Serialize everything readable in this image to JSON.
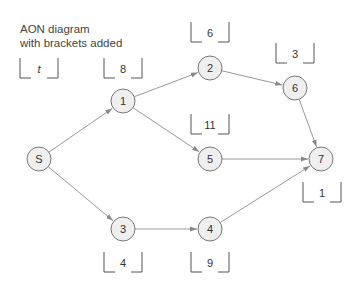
{
  "title": {
    "line1": "AON diagram",
    "line2": "with brackets added"
  },
  "nodes": [
    {
      "id": "S",
      "label": "S",
      "x": 39,
      "y": 159
    },
    {
      "id": "1",
      "label": "1",
      "x": 123,
      "y": 101
    },
    {
      "id": "2",
      "label": "2",
      "x": 210,
      "y": 68
    },
    {
      "id": "6",
      "label": "6",
      "x": 295,
      "y": 88
    },
    {
      "id": "5",
      "label": "5",
      "x": 210,
      "y": 159
    },
    {
      "id": "7",
      "label": "7",
      "x": 321,
      "y": 159
    },
    {
      "id": "3",
      "label": "3",
      "x": 123,
      "y": 229
    },
    {
      "id": "4",
      "label": "4",
      "x": 210,
      "y": 229
    }
  ],
  "edges": [
    {
      "from": "S",
      "to": "1"
    },
    {
      "from": "S",
      "to": "3"
    },
    {
      "from": "1",
      "to": "2"
    },
    {
      "from": "1",
      "to": "5"
    },
    {
      "from": "2",
      "to": "6"
    },
    {
      "from": "6",
      "to": "7"
    },
    {
      "from": "5",
      "to": "7"
    },
    {
      "from": "3",
      "to": "4"
    },
    {
      "from": "4",
      "to": "7"
    }
  ],
  "brackets": [
    {
      "label": "t",
      "italic": true,
      "x": 20,
      "y": 58,
      "w": 38,
      "h": 20
    },
    {
      "label": "8",
      "x": 104,
      "y": 58,
      "w": 38,
      "h": 20
    },
    {
      "label": "6",
      "x": 191,
      "y": 22,
      "w": 38,
      "h": 20
    },
    {
      "label": "3",
      "x": 276,
      "y": 43,
      "w": 38,
      "h": 20
    },
    {
      "label": "11",
      "x": 191,
      "y": 114,
      "w": 38,
      "h": 20
    },
    {
      "label": "1",
      "x": 303,
      "y": 182,
      "w": 38,
      "h": 20
    },
    {
      "label": "4",
      "x": 104,
      "y": 252,
      "w": 38,
      "h": 20
    },
    {
      "label": "9",
      "x": 191,
      "y": 252,
      "w": 38,
      "h": 20
    }
  ],
  "style": {
    "node_fill": "#efefef",
    "node_stroke": "#777777",
    "edge_color": "#999999",
    "text_color": "#333333"
  }
}
